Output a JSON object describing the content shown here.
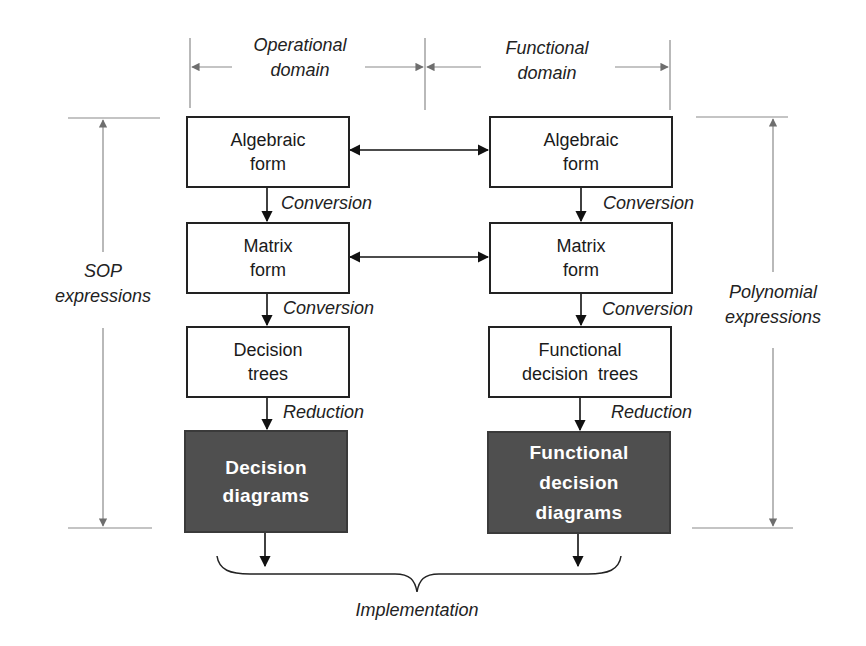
{
  "domains": {
    "operational": [
      "Operational",
      "domain"
    ],
    "functional": [
      "Functional",
      "domain"
    ]
  },
  "side_labels": {
    "left": [
      "SOP",
      "expressions"
    ],
    "right": [
      "Polynomial",
      "expressions"
    ]
  },
  "left_column": {
    "boxes": [
      {
        "lines": [
          "Algebraic",
          "form"
        ]
      },
      {
        "lines": [
          "Matrix",
          "form"
        ]
      },
      {
        "lines": [
          "Decision",
          "trees"
        ]
      },
      {
        "lines": [
          "Decision",
          "diagrams"
        ]
      }
    ],
    "transitions": [
      "Conversion",
      "Conversion",
      "Reduction"
    ]
  },
  "right_column": {
    "boxes": [
      {
        "lines": [
          "Algebraic",
          "form"
        ]
      },
      {
        "lines": [
          "Matrix",
          "form"
        ]
      },
      {
        "lines": [
          "Functional",
          "decision  trees"
        ]
      },
      {
        "lines": [
          "Functional",
          "decision",
          "diagrams"
        ]
      }
    ],
    "transitions": [
      "Conversion",
      "Conversion",
      "Reduction"
    ]
  },
  "bottom_label": "Implementation",
  "colors": {
    "dark_box": "#4f4f4f",
    "guide_line": "#8a8a8a",
    "arrow": "#111111"
  }
}
